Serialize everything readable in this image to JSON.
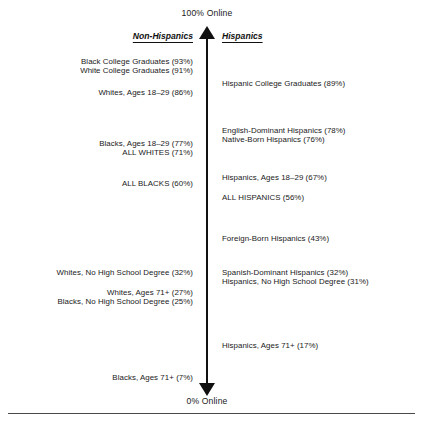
{
  "chart_data": {
    "type": "scatter",
    "title": "",
    "subtitle": "",
    "xlabel": "",
    "ylabel": "Percent Online",
    "ylim": [
      0,
      100
    ],
    "grid": false,
    "legend_position": "top",
    "axis": {
      "top_label": "100% Online",
      "bottom_label": "0% Online",
      "orientation": "vertical",
      "double_headed": true
    },
    "categories": [
      "Non-Hispanics",
      "Hispanics"
    ],
    "series": [
      {
        "name": "Non-Hispanics",
        "side": "left",
        "points": [
          {
            "label": "Black College Graduates (93%)",
            "value": 93,
            "top": 57
          },
          {
            "label": "White College Graduates (91%)",
            "value": 91,
            "top": 66
          },
          {
            "label": "Whites, Ages 18–29 (86%)",
            "value": 86,
            "top": 88
          },
          {
            "label": "Blacks, Ages 18–29 (77%)",
            "value": 77,
            "top": 139
          },
          {
            "label": "ALL WHITES (71%)",
            "value": 71,
            "top": 148
          },
          {
            "label": "ALL BLACKS (60%)",
            "value": 60,
            "top": 179
          },
          {
            "label": "Whites, No High School Degree (32%)",
            "value": 32,
            "top": 268
          },
          {
            "label": "Whites, Ages 71+ (27%)",
            "value": 27,
            "top": 288
          },
          {
            "label": "Blacks, No High School Degree (25%)",
            "value": 25,
            "top": 297
          },
          {
            "label": "Blacks, Ages 71+ (7%)",
            "value": 7,
            "top": 373
          }
        ]
      },
      {
        "name": "Hispanics",
        "side": "right",
        "points": [
          {
            "label": "Hispanic College Graduates (89%)",
            "value": 89,
            "top": 79
          },
          {
            "label": "English-Dominant Hispanics (78%)",
            "value": 78,
            "top": 126
          },
          {
            "label": "Native-Born Hispanics (76%)",
            "value": 76,
            "top": 135
          },
          {
            "label": "Hispanics, Ages 18–29 (67%)",
            "value": 67,
            "top": 173
          },
          {
            "label": "ALL HISPANICS (56%)",
            "value": 56,
            "top": 193
          },
          {
            "label": "Foreign-Born Hispanics (43%)",
            "value": 43,
            "top": 234
          },
          {
            "label": "Spanish-Dominant Hispanics (32%)",
            "value": 32,
            "top": 268
          },
          {
            "label": "Hispanics, No High School Degree (31%)",
            "value": 31,
            "top": 277
          },
          {
            "label": "Hispanics, Ages 71+ (17%)",
            "value": 17,
            "top": 341
          }
        ]
      }
    ]
  },
  "colors": {
    "axis": "#111111",
    "text": "#1a1a1a",
    "rule": "#4a4a4a",
    "background": "#ffffff"
  }
}
